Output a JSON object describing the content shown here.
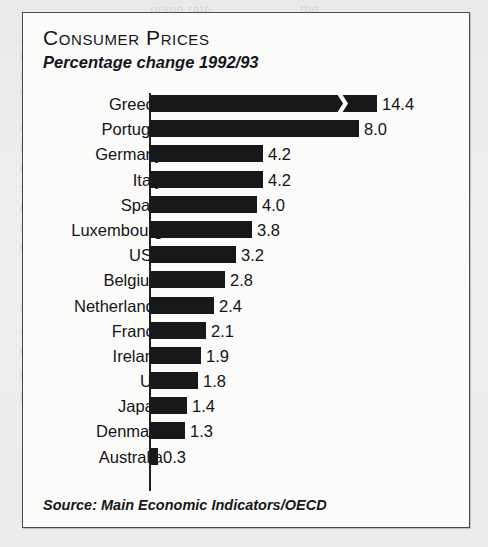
{
  "panel": {
    "title": "Consumer Prices",
    "subtitle": "Percentage change 1992/93",
    "source": "Source: Main Economic Indicators/OECD",
    "border_color": "#4a4a4a",
    "bar_color": "#17181a",
    "background_color": "#fbfbfa"
  },
  "chart_data": {
    "type": "bar",
    "orientation": "horizontal",
    "title": "Consumer Prices",
    "subtitle": "Percentage change 1992/93",
    "xlabel": "",
    "ylabel": "",
    "unit": "percent",
    "grid": false,
    "legend": null,
    "axis_break": {
      "series_index": 0,
      "category": "Greece",
      "note": "zig-zag scale break in the Greece bar; bar is truncated and not drawn to full scale"
    },
    "xlim": [
      0,
      8.6
    ],
    "categories": [
      "Greece",
      "Portugal",
      "Germany",
      "Italy",
      "Spain",
      "Luxembourg",
      "USA",
      "Belgium",
      "Netherlands",
      "France",
      "Ireland",
      "UK",
      "Japan",
      "Denmark",
      "Australia"
    ],
    "values": [
      14.4,
      8.0,
      4.2,
      4.2,
      4.0,
      3.8,
      3.2,
      2.8,
      2.4,
      2.1,
      1.9,
      1.8,
      1.4,
      1.3,
      0.3
    ],
    "value_labels": [
      "14.4",
      "8.0",
      "4.2",
      "4.2",
      "4.0",
      "3.8",
      "3.2",
      "2.8",
      "2.4",
      "2.1",
      "1.9",
      "1.8",
      "1.4",
      "1.3",
      "0.3"
    ],
    "source": "Source: Main Economic Indicators/OECD"
  },
  "rows": [
    {
      "label": "Greece",
      "value_label": "14.4",
      "bar_px": 227,
      "broken": true
    },
    {
      "label": "Portugal",
      "value_label": "8.0",
      "bar_px": 209,
      "broken": false
    },
    {
      "label": "Germany",
      "value_label": "4.2",
      "bar_px": 113,
      "broken": false
    },
    {
      "label": "Italy",
      "value_label": "4.2",
      "bar_px": 113,
      "broken": false
    },
    {
      "label": "Spain",
      "value_label": "4.0",
      "bar_px": 107,
      "broken": false
    },
    {
      "label": "Luxembourg",
      "value_label": "3.8",
      "bar_px": 102,
      "broken": false
    },
    {
      "label": "USA",
      "value_label": "3.2",
      "bar_px": 86,
      "broken": false
    },
    {
      "label": "Belgium",
      "value_label": "2.8",
      "bar_px": 75,
      "broken": false
    },
    {
      "label": "Netherlands",
      "value_label": "2.4",
      "bar_px": 64,
      "broken": false
    },
    {
      "label": "France",
      "value_label": "2.1",
      "bar_px": 56,
      "broken": false
    },
    {
      "label": "Ireland",
      "value_label": "1.9",
      "bar_px": 51,
      "broken": false
    },
    {
      "label": "UK",
      "value_label": "1.8",
      "bar_px": 48,
      "broken": false
    },
    {
      "label": "Japan",
      "value_label": "1.4",
      "bar_px": 37,
      "broken": false
    },
    {
      "label": "Denmark",
      "value_label": "1.3",
      "bar_px": 35,
      "broken": false
    },
    {
      "label": "Australia",
      "value_label": "0.3",
      "bar_px": 8,
      "broken": false
    }
  ],
  "background_text": [
    {
      "text": "prime rate",
      "x": 150,
      "y": 2
    },
    {
      "text": "the",
      "x": 300,
      "y": 2
    },
    {
      "text": "are",
      "x": 20,
      "y": 30
    },
    {
      "text": "in the U.K. with",
      "x": 20,
      "y": 48
    },
    {
      "text": "producers who",
      "x": 20,
      "y": 66
    },
    {
      "text": "contract for a",
      "x": 20,
      "y": 84
    },
    {
      "text": "of some",
      "x": 20,
      "y": 120
    },
    {
      "text": "income illegally",
      "x": 20,
      "y": 140
    },
    {
      "text": "is a growing",
      "x": 20,
      "y": 160
    },
    {
      "text": "subject warning",
      "x": 20,
      "y": 180
    },
    {
      "text": "by gaps that",
      "x": 20,
      "y": 200
    },
    {
      "text": "not a detailed report",
      "x": 20,
      "y": 220
    },
    {
      "text": "there is however a",
      "x": 20,
      "y": 240
    },
    {
      "text": "results in association",
      "x": 20,
      "y": 300
    },
    {
      "text": "appears to increase",
      "x": 20,
      "y": 322
    },
    {
      "text": "the concern",
      "x": 20,
      "y": 344
    },
    {
      "text": "regulation",
      "x": 20,
      "y": 366
    },
    {
      "text": "less",
      "x": 20,
      "y": 390
    }
  ]
}
